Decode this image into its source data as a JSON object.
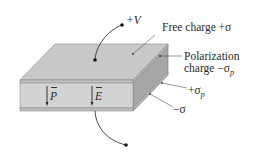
{
  "diagram": {
    "labels": {
      "voltage": "+V",
      "free_charge": "Free charge +σ",
      "polarization_line1": "Polarization",
      "polarization_line2_prefix": "charge −σ",
      "polarization_line2_sub": "p",
      "plus_sigma_p_prefix": "+σ",
      "plus_sigma_p_sub": "p",
      "minus_sigma": "−σ",
      "vector_P": "P",
      "vector_E": "E"
    },
    "colors": {
      "top_face": "#c9c9c9",
      "front_face": "#d2d2d2",
      "side_face": "#a8a8a8",
      "plate_band": "#bcbcbc",
      "edge": "#7a7a7a",
      "ink": "#222222"
    }
  }
}
